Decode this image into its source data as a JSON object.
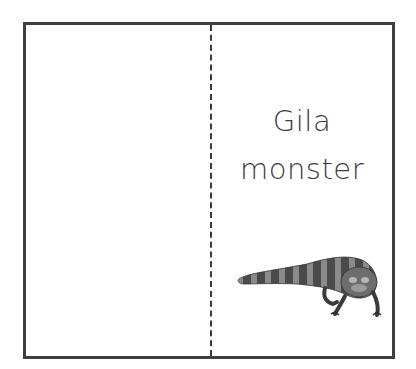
{
  "card": {
    "left_panel": {
      "content": ""
    },
    "right_panel": {
      "title_line1": "Gila",
      "title_line2": "monster",
      "image": "gila-monster-lizard"
    },
    "fold_line": "dashed",
    "colors": {
      "border": "#404040",
      "text": "#3c3c3c",
      "background": "#ffffff"
    }
  }
}
